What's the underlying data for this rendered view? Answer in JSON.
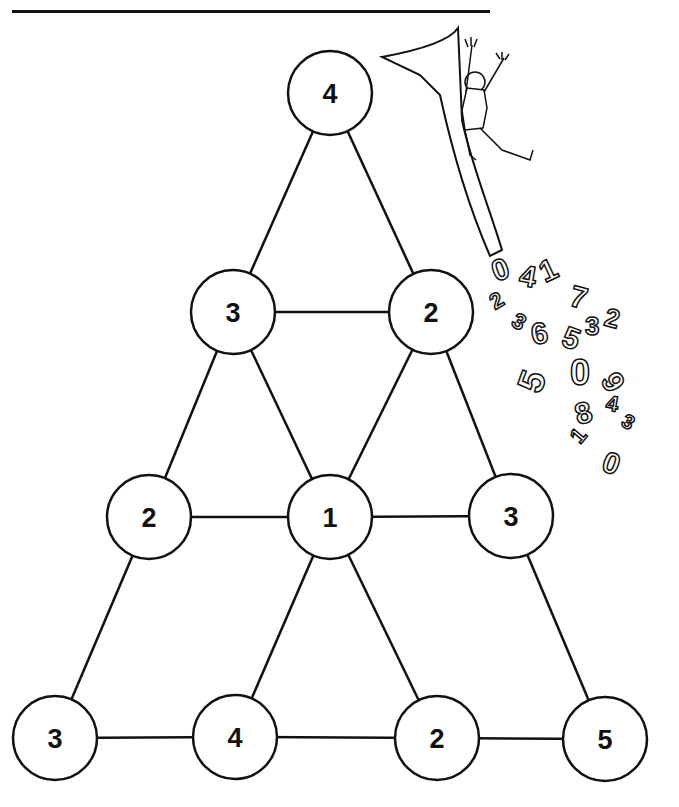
{
  "puzzle": {
    "nodes": [
      {
        "id": "n1",
        "value": "4",
        "x": 330,
        "y": 93,
        "r": 42
      },
      {
        "id": "n2",
        "value": "3",
        "x": 233,
        "y": 312,
        "r": 42
      },
      {
        "id": "n3",
        "value": "2",
        "x": 431,
        "y": 312,
        "r": 42
      },
      {
        "id": "n4",
        "value": "2",
        "x": 149,
        "y": 517,
        "r": 42
      },
      {
        "id": "n5",
        "value": "1",
        "x": 330,
        "y": 517,
        "r": 42
      },
      {
        "id": "n6",
        "value": "3",
        "x": 511,
        "y": 516,
        "r": 42
      },
      {
        "id": "n7",
        "value": "3",
        "x": 55,
        "y": 738,
        "r": 42
      },
      {
        "id": "n8",
        "value": "4",
        "x": 235,
        "y": 737,
        "r": 42
      },
      {
        "id": "n9",
        "value": "2",
        "x": 437,
        "y": 738,
        "r": 42
      },
      {
        "id": "n10",
        "value": "5",
        "x": 605,
        "y": 739,
        "r": 42
      }
    ],
    "edges": [
      [
        "n1",
        "n2"
      ],
      [
        "n1",
        "n3"
      ],
      [
        "n2",
        "n3"
      ],
      [
        "n2",
        "n4"
      ],
      [
        "n2",
        "n5"
      ],
      [
        "n3",
        "n5"
      ],
      [
        "n3",
        "n6"
      ],
      [
        "n4",
        "n5"
      ],
      [
        "n5",
        "n6"
      ],
      [
        "n4",
        "n7"
      ],
      [
        "n5",
        "n8"
      ],
      [
        "n5",
        "n9"
      ],
      [
        "n6",
        "n10"
      ],
      [
        "n7",
        "n8"
      ],
      [
        "n8",
        "n9"
      ],
      [
        "n9",
        "n10"
      ]
    ]
  },
  "illustration": {
    "description": "cartoon boy sliding down a giant number 7 into a pile of tumbling digits",
    "tumbling_digits": [
      "0",
      "4",
      "1",
      "7",
      "2",
      "3",
      "6",
      "5",
      "3",
      "2",
      "0",
      "9",
      "5",
      "8",
      "4",
      "3",
      "1",
      "0"
    ]
  },
  "colors": {
    "ink": "#111111",
    "paper": "#ffffff"
  }
}
